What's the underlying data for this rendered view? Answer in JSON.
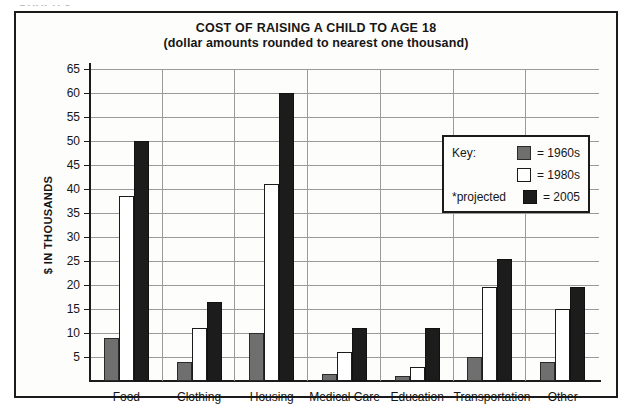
{
  "caption": "GRAPH 5",
  "chart_data": {
    "type": "bar",
    "title": "COST OF RAISING A CHILD TO AGE 18",
    "subtitle": "(dollar amounts rounded to nearest one thousand)",
    "xlabel": "",
    "ylabel": "$ IN THOUSANDS",
    "ylim": [
      0,
      65
    ],
    "ytick_step": 5,
    "yticks": [
      5,
      10,
      15,
      20,
      25,
      30,
      35,
      40,
      45,
      50,
      55,
      60,
      65
    ],
    "grid": true,
    "legend_position": "upper-right",
    "categories": [
      "Food",
      "Clothing",
      "Housing",
      "Medical Care",
      "Education",
      "Transportation",
      "Other"
    ],
    "series": [
      {
        "name": "1960s",
        "color": "#6f6f6f",
        "values": [
          9,
          4,
          10,
          1.5,
          1,
          5,
          4
        ]
      },
      {
        "name": "1980s",
        "color": "#ffffff",
        "values": [
          38.5,
          11,
          41,
          6,
          3,
          19.5,
          15
        ]
      },
      {
        "name": "2005",
        "color": "#1c1c1c",
        "values": [
          50,
          16.5,
          60,
          11,
          11,
          25.5,
          19.5
        ]
      }
    ],
    "annotations": [
      "*projected"
    ]
  },
  "legend": {
    "key_label": "Key:",
    "projected_label": "*projected",
    "rows": [
      {
        "equals": "= 1960s"
      },
      {
        "equals": "= 1980s"
      },
      {
        "equals": "= 2005"
      }
    ]
  },
  "colors": {
    "frame": "#1b1b1b",
    "gridline": "#9a9a9a",
    "background": "#fdfdfc",
    "text": "#161616"
  }
}
